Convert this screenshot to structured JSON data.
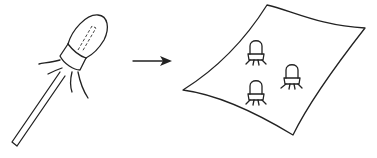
{
  "diagram": {
    "elements": [
      {
        "id": "swab",
        "icon": "swab-icon"
      },
      {
        "id": "arrow",
        "icon": "arrow-right-icon"
      },
      {
        "id": "surface",
        "icon": "sheet-icon"
      },
      {
        "id": "microbes",
        "icon": "microbe-icon",
        "count": 3
      }
    ],
    "colors": {
      "stroke": "#222222",
      "background": "#ffffff"
    }
  }
}
